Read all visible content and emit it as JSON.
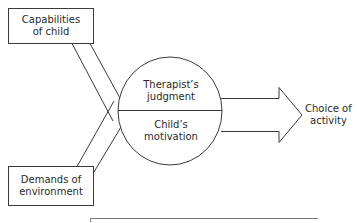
{
  "diagram": {
    "inputs": {
      "top": {
        "label_line1": "Capabilities",
        "label_line2": "of child"
      },
      "bottom": {
        "label_line1": "Demands of",
        "label_line2": "environment"
      }
    },
    "center": {
      "upper": {
        "line1": "Therapist’s",
        "line2": "judgment"
      },
      "lower": {
        "line1": "Child’s",
        "line2": "motivation"
      }
    },
    "output": {
      "line1": "Choice of",
      "line2": "activity"
    },
    "colors": {
      "stroke": "#3a3a3a",
      "background": "#ffffff",
      "text": "#2a2a2a"
    }
  }
}
